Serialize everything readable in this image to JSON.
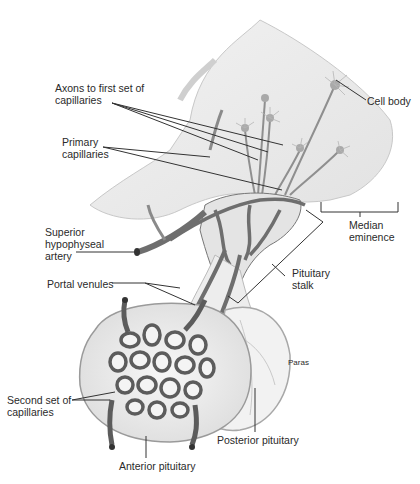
{
  "diagram": {
    "labels": {
      "axons": "Axons to first set of\ncapillaries",
      "primary_capillaries": "Primary\ncapillaries",
      "cell_body": "Cell body",
      "superior_artery": "Superior\nhypophyseal\nartery",
      "median_eminence": "Median\neminence",
      "portal_venules": "Portal venules",
      "pituitary_stalk": "Pituitary\nstalk",
      "paras": "Paras",
      "second_capillaries": "Second set of\ncapillaries",
      "posterior_pituitary": "Posterior pituitary",
      "anterior_pituitary": "Anterior pituitary"
    },
    "colors": {
      "tissue": "#ececec",
      "tissue_edge": "#bdbdbd",
      "vessel": "#6e6e6e",
      "vessel_dark": "#4a4a4a",
      "leader": "#333333"
    }
  }
}
